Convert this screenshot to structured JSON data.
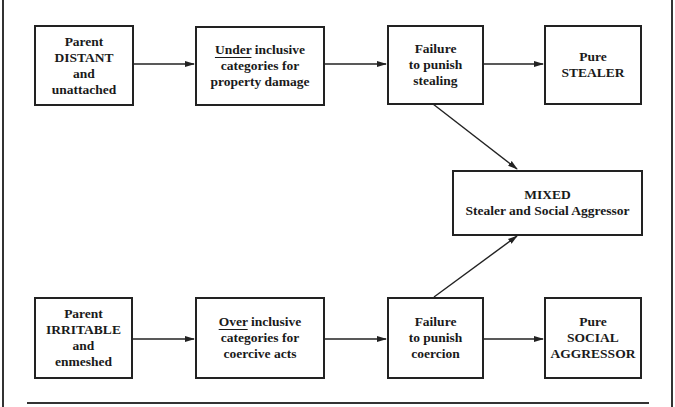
{
  "diagram": {
    "nodes": {
      "parent_distant": {
        "lines": [
          "Parent",
          "DISTANT",
          "and",
          "unattached"
        ]
      },
      "under_inclusive": {
        "underlined": "Under",
        "line1_rest": " inclusive",
        "lines": [
          "categories for",
          "property damage"
        ]
      },
      "fail_stealing": {
        "lines": [
          "Failure",
          "to punish",
          "stealing"
        ]
      },
      "pure_stealer": {
        "lines": [
          "Pure",
          "STEALER"
        ]
      },
      "mixed": {
        "lines": [
          "MIXED",
          "Stealer and Social Aggressor"
        ]
      },
      "parent_irritable": {
        "lines": [
          "Parent",
          "IRRITABLE",
          "and",
          "enmeshed"
        ]
      },
      "over_inclusive": {
        "underlined": "Over",
        "line1_rest": " inclusive",
        "lines": [
          "categories for",
          "coercive acts"
        ]
      },
      "fail_coercion": {
        "lines": [
          "Failure",
          "to punish",
          "coercion"
        ]
      },
      "pure_aggressor": {
        "lines": [
          "Pure",
          "SOCIAL",
          "AGGRESSOR"
        ]
      }
    },
    "edges": [
      {
        "from": "parent_distant",
        "to": "under_inclusive"
      },
      {
        "from": "under_inclusive",
        "to": "fail_stealing"
      },
      {
        "from": "fail_stealing",
        "to": "pure_stealer"
      },
      {
        "from": "fail_stealing",
        "to": "mixed"
      },
      {
        "from": "parent_irritable",
        "to": "over_inclusive"
      },
      {
        "from": "over_inclusive",
        "to": "fail_coercion"
      },
      {
        "from": "fail_coercion",
        "to": "pure_aggressor"
      },
      {
        "from": "fail_coercion",
        "to": "mixed"
      }
    ]
  }
}
